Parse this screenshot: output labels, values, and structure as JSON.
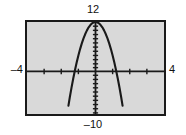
{
  "figure": {
    "frame_color": "#1a1a1a",
    "screen_color": "#d9d9d9",
    "curve_color": "#1a1a1a"
  },
  "labels": {
    "y_max": "12",
    "y_min": "–10",
    "x_min": "–4",
    "x_max": "4"
  },
  "chart_data": {
    "type": "line",
    "title": "",
    "subtitle": "",
    "xlabel": "",
    "ylabel": "",
    "xlim": [
      -4,
      4
    ],
    "ylim": [
      -10,
      12
    ],
    "grid": false,
    "legend": null,
    "axes": {
      "x_axis_at_y": 0,
      "y_axis_at_x": 0,
      "x_tick_step": 1,
      "y_tick_step": 1,
      "x_tick_labels": [
        "-4",
        "4"
      ],
      "y_tick_labels": [
        "-10",
        "12"
      ]
    },
    "annotations": [],
    "series": [
      {
        "name": "parabola",
        "equation": "y = 12 - 8x^2",
        "vertex": [
          0,
          12
        ],
        "x_intercepts": [
          -1.22,
          1.22
        ],
        "x": [
          -1.58,
          -1.5,
          -1.4,
          -1.3,
          -1.2,
          -1.1,
          -1.0,
          -0.9,
          -0.8,
          -0.7,
          -0.6,
          -0.5,
          -0.4,
          -0.3,
          -0.2,
          -0.1,
          0.0,
          0.1,
          0.2,
          0.3,
          0.4,
          0.5,
          0.6,
          0.7,
          0.8,
          0.9,
          1.0,
          1.1,
          1.2,
          1.3,
          1.4,
          1.5,
          1.58
        ],
        "values": [
          -8.0,
          -6.0,
          -3.68,
          -1.52,
          0.48,
          2.32,
          4.0,
          5.52,
          6.88,
          8.08,
          9.12,
          10.0,
          10.72,
          11.28,
          11.68,
          11.92,
          12.0,
          11.92,
          11.68,
          11.28,
          10.72,
          10.0,
          9.12,
          8.08,
          6.88,
          5.52,
          4.0,
          2.32,
          0.48,
          -1.52,
          -3.68,
          -6.0,
          -8.0
        ]
      }
    ]
  }
}
